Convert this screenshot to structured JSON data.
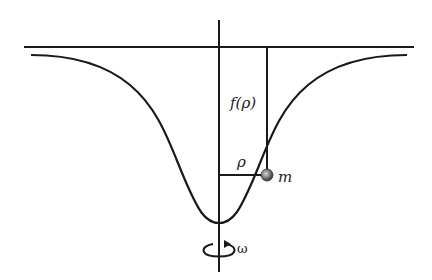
{
  "diagram": {
    "labels": {
      "height": "f(ρ)",
      "radius": "ρ",
      "mass": "m",
      "angular_velocity": "ω"
    },
    "icons": {
      "rotation": "rotation-arrow-icon"
    },
    "colors": {
      "stroke": "#1a1a1a",
      "mass_fill": "#666666"
    }
  }
}
